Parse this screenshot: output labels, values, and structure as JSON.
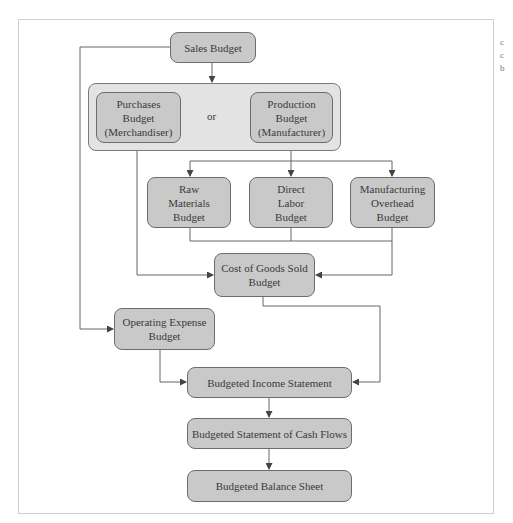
{
  "diagram": {
    "nodes": {
      "sales": "Sales Budget",
      "purchases": "Purchases\nBudget\n(Merchandiser)",
      "or_label": "or",
      "production": "Production\nBudget\n(Manufacturer)",
      "raw_materials": "Raw\nMaterials\nBudget",
      "direct_labor": "Direct\nLabor\nBudget",
      "manufacturing_overhead": "Manufacturing\nOverhead\nBudget",
      "cogs": "Cost of Goods Sold\nBudget",
      "operating_expense": "Operating Expense\nBudget",
      "income_statement": "Budgeted Income Statement",
      "cash_flows": "Budgeted Statement of Cash Flows",
      "balance_sheet": "Budgeted Balance Sheet"
    },
    "edges": [
      [
        "Sales Budget",
        "Purchases/Production group"
      ],
      [
        "Sales Budget",
        "Operating Expense Budget"
      ],
      [
        "Production Budget",
        "Raw Materials Budget"
      ],
      [
        "Production Budget",
        "Direct Labor Budget"
      ],
      [
        "Production Budget",
        "Manufacturing Overhead Budget"
      ],
      [
        "Purchases Budget",
        "Cost of Goods Sold Budget"
      ],
      [
        "Raw/Labor/Overhead Budgets",
        "Cost of Goods Sold Budget"
      ],
      [
        "Cost of Goods Sold Budget",
        "Budgeted Income Statement"
      ],
      [
        "Operating Expense Budget",
        "Budgeted Income Statement"
      ],
      [
        "Budgeted Income Statement",
        "Budgeted Statement of Cash Flows"
      ],
      [
        "Budgeted Statement of Cash Flows",
        "Budgeted Balance Sheet"
      ]
    ],
    "colors": {
      "box_fill": "#c9c9c9",
      "group_fill": "#e3e3e3",
      "border": "#6d6d6d",
      "line": "#555555"
    }
  },
  "side_text": [
    "c",
    "c",
    "b"
  ]
}
